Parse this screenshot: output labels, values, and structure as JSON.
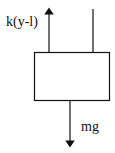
{
  "diagram": {
    "labels": {
      "spring_force": "k(y-l)",
      "gravity_force": "mg"
    },
    "elements": [
      {
        "type": "block",
        "name": "mass"
      },
      {
        "type": "force-arrow",
        "direction": "up",
        "label": "k(y-l)"
      },
      {
        "type": "force-arrow",
        "direction": "down",
        "label": "mg"
      },
      {
        "type": "line",
        "name": "support-line"
      }
    ],
    "colors": {
      "stroke": "#111111",
      "background": "#ffffff"
    }
  }
}
